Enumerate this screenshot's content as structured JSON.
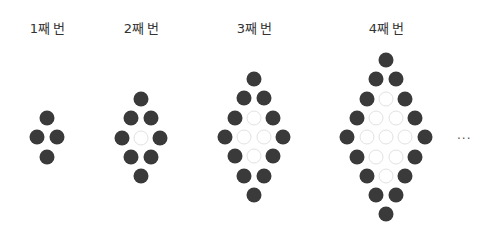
{
  "figures": [
    {
      "label": "1째 번",
      "center_x": 47,
      "top_y": 118,
      "n": 1
    },
    {
      "label": "2째 번",
      "center_x": 141,
      "top_y": 99,
      "n": 2
    },
    {
      "label": "3째 번",
      "center_x": 254,
      "top_y": 79,
      "n": 3
    },
    {
      "label": "4째 번",
      "center_x": 386,
      "top_y": 60,
      "n": 4
    }
  ],
  "ellipsis": "...",
  "colors": {
    "filled": "#3a3a3a",
    "empty_border": "#e2e2e2"
  },
  "spacing": {
    "row": 19.3,
    "col": 19.3
  }
}
